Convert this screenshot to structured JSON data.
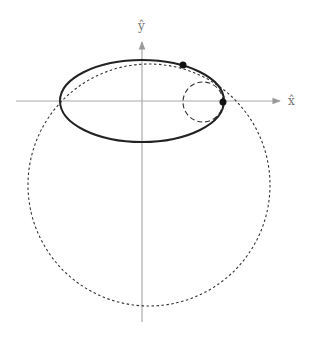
{
  "diagram": {
    "type": "orbital-geometry",
    "axes": {
      "x_label": "x̂",
      "y_label": "ŷ",
      "color": "#999999",
      "origin": [
        142,
        101
      ],
      "x_axis": {
        "x1": 16,
        "x2": 280,
        "y": 101
      },
      "y_axis": {
        "x": 142,
        "y1": 322,
        "y2": 42
      }
    },
    "ellipse": {
      "style": "solid",
      "color": "#222222",
      "cx": 142,
      "cy": 101,
      "rx": 82,
      "ry": 41
    },
    "large_circle": {
      "style": "dotted",
      "color": "#333333",
      "cx": 149,
      "cy": 185,
      "r": 121
    },
    "small_circle": {
      "style": "dashed",
      "color": "#333333",
      "cx": 203,
      "cy": 102,
      "r": 20
    },
    "points": [
      {
        "name": "upper-point",
        "x": 183,
        "y": 65,
        "r": 3.5,
        "color": "#111111"
      },
      {
        "name": "periapsis-point",
        "x": 223,
        "y": 102,
        "r": 3.5,
        "color": "#111111"
      }
    ]
  }
}
